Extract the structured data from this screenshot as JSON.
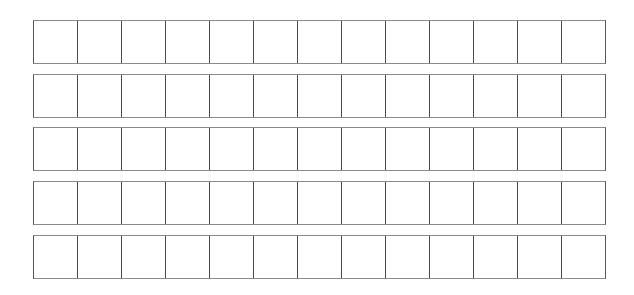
{
  "grid": {
    "rows": 5,
    "columns": 13,
    "row_tops_px": [
      20,
      74,
      127,
      181,
      235
    ],
    "row_height_px": 44,
    "left_px": 33,
    "width_px": 573,
    "colors": {
      "background": "#ffffff",
      "cell_divider": "#4a4a4a",
      "horizontal_border": "#8a8a8a",
      "outer_vertical_border": "#555555"
    },
    "cells": [
      [
        "",
        "",
        "",
        "",
        "",
        "",
        "",
        "",
        "",
        "",
        "",
        "",
        ""
      ],
      [
        "",
        "",
        "",
        "",
        "",
        "",
        "",
        "",
        "",
        "",
        "",
        "",
        ""
      ],
      [
        "",
        "",
        "",
        "",
        "",
        "",
        "",
        "",
        "",
        "",
        "",
        "",
        ""
      ],
      [
        "",
        "",
        "",
        "",
        "",
        "",
        "",
        "",
        "",
        "",
        "",
        "",
        ""
      ],
      [
        "",
        "",
        "",
        "",
        "",
        "",
        "",
        "",
        "",
        "",
        "",
        "",
        ""
      ]
    ]
  }
}
